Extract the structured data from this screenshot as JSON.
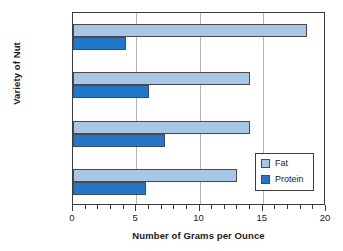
{
  "chart_data": {
    "type": "bar",
    "orientation": "horizontal",
    "title": "",
    "xlabel": "Number of Grams per Ounce",
    "ylabel": "Variety of Nut",
    "categories": [
      "Walnuts",
      "Almonds",
      "Peanuts",
      "Pistachios"
    ],
    "series": [
      {
        "name": "Fat",
        "color": "#a8c6e8",
        "values": [
          18.5,
          14,
          14,
          13
        ]
      },
      {
        "name": "Protein",
        "color": "#2277cc",
        "values": [
          4.2,
          6,
          7.3,
          5.8
        ]
      }
    ],
    "xlim": [
      0,
      20
    ],
    "x_major_ticks": [
      0,
      5,
      10,
      15,
      20
    ],
    "x_tick_labels": [
      "0",
      "5",
      "10",
      "15",
      "20"
    ],
    "x_minor_tick_interval": 1,
    "grid": "vertical-major",
    "legend": {
      "position": "inside-bottom-right",
      "entries": [
        "Fat",
        "Protein"
      ]
    }
  }
}
